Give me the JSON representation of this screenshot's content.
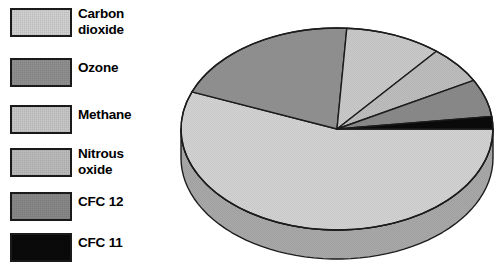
{
  "legend": {
    "title": "Greenhouse gas legend",
    "items": [
      {
        "label": "Carbon\ndioxide",
        "plain": "Carbon dioxide",
        "color": "#d2d2d2",
        "swatch_name": "swatch-carbon-dioxide"
      },
      {
        "label": "Ozone",
        "plain": "Ozone",
        "color": "#919191",
        "swatch_name": "swatch-ozone"
      },
      {
        "label": "Methane",
        "plain": "Methane",
        "color": "#c9c9c9",
        "swatch_name": "swatch-methane"
      },
      {
        "label": "Nitrous\noxide",
        "plain": "Nitrous oxide",
        "color": "#bdbdbd",
        "swatch_name": "swatch-nitrous-oxide"
      },
      {
        "label": "CFC 12",
        "plain": "CFC 12",
        "color": "#8a8a8a",
        "swatch_name": "swatch-cfc-12"
      },
      {
        "label": "CFC 11",
        "plain": "CFC 11",
        "color": "#0a0a0a",
        "swatch_name": "swatch-cfc-11"
      }
    ]
  },
  "chart_data": {
    "type": "pie",
    "title": "",
    "subtitle": "",
    "xlabel": "",
    "ylabel": "",
    "grid": false,
    "legend_position": "left",
    "three_d": true,
    "start_angle_deg": 0,
    "direction": "clockwise",
    "labels": [
      "Carbon dioxide",
      "Ozone",
      "Methane",
      "Nitrous oxide",
      "CFC 12",
      "CFC 11"
    ],
    "values": [
      56,
      20,
      10,
      6,
      6,
      2
    ],
    "units": "percent",
    "colors": [
      "#d2d2d2",
      "#919191",
      "#c9c9c9",
      "#bdbdbd",
      "#8a8a8a",
      "#0a0a0a"
    ],
    "side_colors": [
      "#a8a8a8",
      "#6e6e6e",
      "#a0a0a0",
      "#979797",
      "#6a6a6a",
      "#080808"
    ],
    "slices": [
      {
        "name": "Carbon dioxide",
        "value": 56,
        "color": "#d2d2d2"
      },
      {
        "name": "Ozone",
        "value": 20,
        "color": "#919191"
      },
      {
        "name": "Methane",
        "value": 10,
        "color": "#c9c9c9"
      },
      {
        "name": "Nitrous oxide",
        "value": 6,
        "color": "#bdbdbd"
      },
      {
        "name": "CFC 12",
        "value": 6,
        "color": "#8a8a8a"
      },
      {
        "name": "CFC 11",
        "value": 2,
        "color": "#0a0a0a"
      }
    ],
    "geometry": {
      "cx": 169,
      "cy": 111,
      "rx": 156,
      "ry": 101,
      "depth": 29,
      "stroke": "#1c1c1c",
      "stroke_width": 1.4
    }
  }
}
